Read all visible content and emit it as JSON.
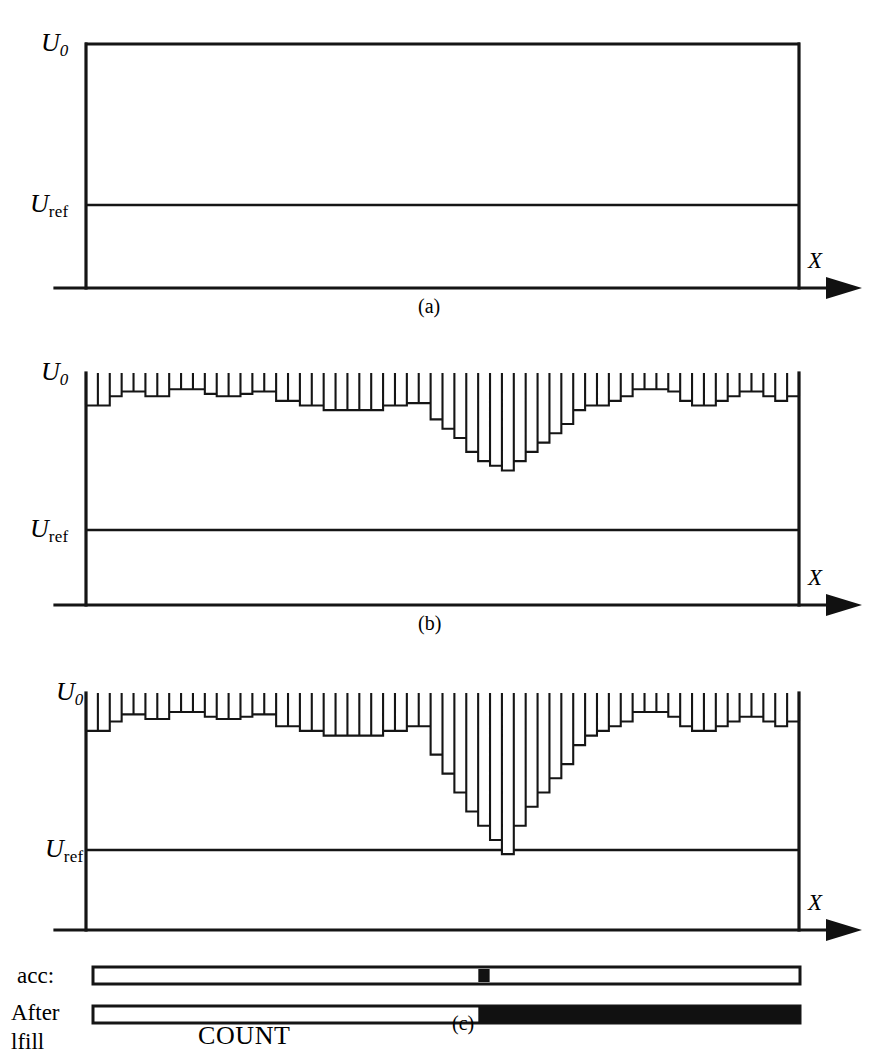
{
  "figure": {
    "background_color": "#ffffff",
    "ink_color": "#151515"
  },
  "labels": {
    "u0_base": "U",
    "u0_sub": "0",
    "uref_base": "U",
    "uref_sub": "ref",
    "x_axis": "X",
    "caption_a": "(a)",
    "caption_b": "(b)",
    "caption_c": "(c)",
    "legend_acc": "acc:",
    "legend_after": "After",
    "legend_lfill": "lfill",
    "count": "COUNT"
  },
  "chart_data": {
    "type": "bar",
    "xlabel": "X",
    "ylabel": "U",
    "ytick_labels": [
      "U0",
      "Uref"
    ],
    "grid": false,
    "legend": "none",
    "levels": {
      "u0": 1.0,
      "uref": 0.36,
      "baseline": 0.0
    },
    "panels": [
      {
        "id": "a",
        "caption": "(a)",
        "description": "Flat full-level trace at U0 with no bar structure; reference line at Uref.",
        "bar_count": 0,
        "values": []
      },
      {
        "id": "b",
        "caption": "(b)",
        "description": "Bar histogram with shallow ripples and a central dip that does not reach Uref.",
        "bar_count": 60,
        "values": [
          0.86,
          0.86,
          0.9,
          0.92,
          0.92,
          0.9,
          0.9,
          0.93,
          0.93,
          0.93,
          0.91,
          0.9,
          0.9,
          0.91,
          0.92,
          0.92,
          0.88,
          0.88,
          0.86,
          0.86,
          0.84,
          0.84,
          0.84,
          0.84,
          0.84,
          0.86,
          0.86,
          0.87,
          0.87,
          0.8,
          0.76,
          0.72,
          0.66,
          0.62,
          0.6,
          0.58,
          0.62,
          0.66,
          0.7,
          0.74,
          0.78,
          0.84,
          0.86,
          0.86,
          0.88,
          0.9,
          0.93,
          0.93,
          0.93,
          0.92,
          0.88,
          0.86,
          0.86,
          0.88,
          0.9,
          0.92,
          0.92,
          0.9,
          0.88,
          0.9
        ]
      },
      {
        "id": "c",
        "caption": "(c)",
        "description": "Bar histogram with the same ripples but a much deeper central dip; one bar falls below Uref.",
        "bar_count": 60,
        "values": [
          0.84,
          0.84,
          0.88,
          0.91,
          0.91,
          0.89,
          0.89,
          0.92,
          0.92,
          0.92,
          0.9,
          0.89,
          0.89,
          0.9,
          0.91,
          0.91,
          0.86,
          0.86,
          0.84,
          0.84,
          0.82,
          0.82,
          0.82,
          0.82,
          0.82,
          0.84,
          0.84,
          0.86,
          0.86,
          0.74,
          0.66,
          0.58,
          0.5,
          0.44,
          0.38,
          0.32,
          0.44,
          0.52,
          0.58,
          0.64,
          0.7,
          0.78,
          0.82,
          0.84,
          0.86,
          0.88,
          0.92,
          0.92,
          0.92,
          0.9,
          0.86,
          0.84,
          0.84,
          0.86,
          0.88,
          0.9,
          0.9,
          0.88,
          0.86,
          0.88
        ],
        "below_ref_bar_index": 35,
        "below_ref_value": 0.32
      }
    ],
    "legend_bars": [
      {
        "name": "acc:",
        "fill_fraction": 0.0,
        "marker_position": 0.545,
        "marker_width": 0.016,
        "description": "Empty bar with a small filled tick at the position of the deep dip."
      },
      {
        "name": "After lfill",
        "fill_fraction": 0.545,
        "description": "Bar filled solid black from the dip position to the right end."
      }
    ]
  }
}
